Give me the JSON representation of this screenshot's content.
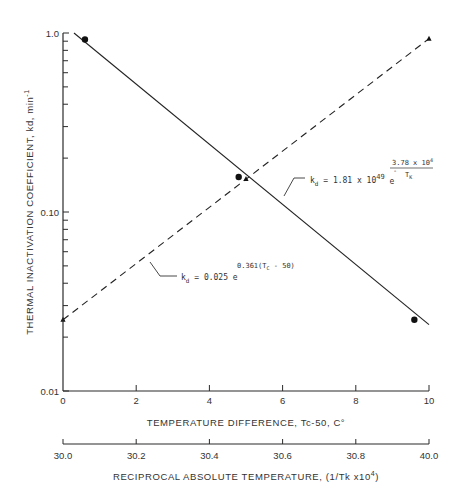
{
  "chart_data": {
    "type": "line",
    "title": "",
    "ylabel": "THERMAL INACTIVATION COEFFICIENT, kd, min",
    "ylabel_sup": "-1",
    "xlabel": "TEMPERATURE DIFFERENCE, Tc-50, C°",
    "x2label": "RECIPROCAL ABSOLUTE TEMPERATURE, (1/Tk x10",
    "x2label_sup": "4",
    "x2label_end": ")",
    "yscale": "log",
    "ylim": [
      0.01,
      1.0
    ],
    "xlim": [
      0,
      10
    ],
    "grid": false,
    "y_ticks": [
      "1.0",
      "0.10",
      "0.01"
    ],
    "x_ticks": [
      "0",
      "2",
      "4",
      "6",
      "8",
      "10"
    ],
    "x2_ticks": [
      "30.0",
      "30.2",
      "30.4",
      "30.6",
      "30.8",
      "40.0"
    ],
    "series": [
      {
        "name": "kd = 1.81 x 10^49 e^(-3.78 x 10^4 / TK)",
        "style": "solid",
        "marker": "circle",
        "line": [
          [
            0.3,
            1.0
          ],
          [
            10.0,
            0.0235
          ]
        ],
        "points": [
          [
            0.6,
            0.92
          ],
          [
            4.8,
            0.157
          ],
          [
            9.6,
            0.025
          ]
        ]
      },
      {
        "name": "kd = 0.025 e^(0.361(TC - 50))",
        "style": "dashed",
        "marker": "triangle",
        "line": [
          [
            0.0,
            0.025
          ],
          [
            10.0,
            0.93
          ]
        ],
        "points": [
          [
            0.0,
            0.025
          ],
          [
            5.0,
            0.153
          ],
          [
            10.0,
            0.93
          ]
        ]
      }
    ],
    "annotations": [
      {
        "series": 0,
        "text_prefix": "k",
        "text_sub": "d",
        "text_main": " = 1.81 x 10",
        "text_exp": "49",
        "text_e": " e",
        "frac_num": "3.78 x 10",
        "frac_num_exp": "4",
        "frac_den": "T",
        "frac_den_sub": "K",
        "frac_sign": "-"
      },
      {
        "series": 1,
        "text_prefix": "k",
        "text_sub": "d",
        "text_main": " = 0.025 e",
        "exp_text": "0.361(T",
        "exp_sub": "C",
        "exp_end": " - 50)"
      }
    ]
  }
}
